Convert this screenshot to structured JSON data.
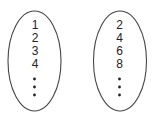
{
  "sets": [
    {
      "name": "natural-numbers",
      "elements": [
        "1",
        "2",
        "3",
        "4"
      ],
      "continuation": "vertical-ellipsis"
    },
    {
      "name": "even-numbers",
      "elements": [
        "2",
        "4",
        "6",
        "8"
      ],
      "continuation": "vertical-ellipsis"
    }
  ]
}
